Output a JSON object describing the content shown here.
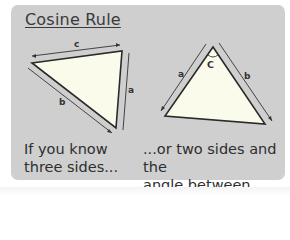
{
  "title": "Cosine Rule",
  "left_diagram": {
    "labels": {
      "top": "c",
      "right": "a",
      "left": "b"
    },
    "caption_line1": "If you know",
    "caption_line2": "three sides..."
  },
  "right_diagram": {
    "labels": {
      "left": "a",
      "right": "b",
      "angle": "C"
    },
    "caption_line1": "...or two sides and the",
    "caption_line2": "angle between them."
  },
  "colors": {
    "panel": "#cfcfcf",
    "triangle_fill": "#fbfbeb",
    "stroke": "#2a2a2a",
    "text": "#2e2e2e"
  }
}
